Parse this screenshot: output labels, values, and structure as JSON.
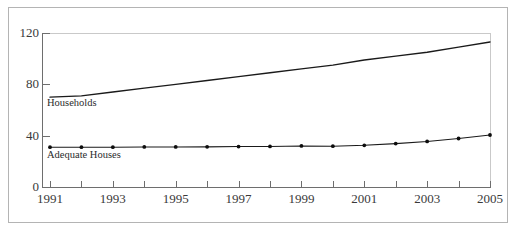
{
  "chart_data": {
    "type": "line",
    "title": "",
    "subtitle": "",
    "xlabel": "",
    "ylabel": "",
    "xlim": [
      1991,
      2005
    ],
    "ylim": [
      0,
      120
    ],
    "grid": false,
    "legend_position": "inline-annotation",
    "x": [
      1991,
      1992,
      1993,
      1994,
      1995,
      1996,
      1997,
      1998,
      1999,
      2000,
      2001,
      2002,
      2003,
      2004,
      2005
    ],
    "xtick_labels": [
      "1991",
      "",
      "1993",
      "",
      "1995",
      "",
      "1997",
      "",
      "1999",
      "",
      "2001",
      "",
      "2003",
      "",
      "2005"
    ],
    "xticks_major": [
      1991,
      1993,
      1995,
      1997,
      1999,
      2001,
      2003,
      2005
    ],
    "yticks": [
      0,
      40,
      80,
      120
    ],
    "ytick_labels": [
      "0",
      "40",
      "80",
      "120"
    ],
    "series": [
      {
        "name": "Households",
        "label": "Households",
        "markers": false,
        "color": "#1a1a1a",
        "line_width": 1.4,
        "values": [
          70,
          71,
          74,
          77,
          80,
          83,
          86,
          89,
          92,
          95,
          99,
          102,
          105,
          109,
          113
        ]
      },
      {
        "name": "Adequate Houses",
        "label": "Adequate Houses",
        "markers": true,
        "color": "#1a1a1a",
        "line_width": 1.1,
        "marker_color": "#0d0d0d",
        "values": [
          31,
          31,
          31,
          31.2,
          31.2,
          31.3,
          31.5,
          31.6,
          32,
          31.8,
          32.5,
          33.8,
          35.5,
          37.8,
          40.5
        ]
      }
    ]
  },
  "annotations": {
    "households_label": "Households",
    "adequate_label": "Adequate Houses"
  },
  "colors": {
    "frame": "#b4b4b4",
    "axis": "#6e6e6e",
    "plot_box": "#c9c9c9",
    "line": "#1a1a1a",
    "text": "#3a3a3a",
    "background": "#ffffff"
  }
}
